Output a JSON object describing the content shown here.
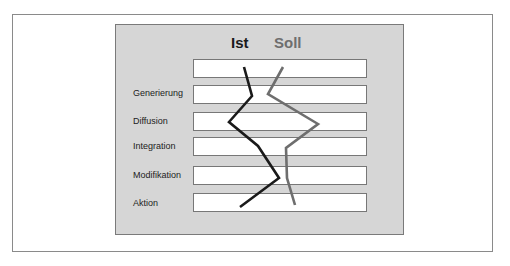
{
  "diagram": {
    "headers": {
      "ist": "Ist",
      "soll": "Soll"
    },
    "rows": [
      {
        "label": ""
      },
      {
        "label": "Generierung"
      },
      {
        "label": "Diffusion"
      },
      {
        "label": "Integration"
      },
      {
        "label": "Modifikation"
      },
      {
        "label": "Aktion"
      }
    ],
    "series": [
      {
        "name": "Ist",
        "color": "#1a1a1a",
        "points": [
          [
            244,
            67
          ],
          [
            252,
            96
          ],
          [
            229,
            122
          ],
          [
            258,
            146
          ],
          [
            279,
            178
          ],
          [
            240,
            207
          ]
        ]
      },
      {
        "name": "Soll",
        "color": "#6e6e6e",
        "points": [
          [
            283,
            67
          ],
          [
            268,
            94
          ],
          [
            318,
            124
          ],
          [
            286,
            148
          ],
          [
            287,
            178
          ],
          [
            295,
            205
          ]
        ]
      }
    ],
    "colors": {
      "panel": "#d6d6d6",
      "bar": "#ffffff",
      "ist": "#1a1a1a",
      "soll": "#6e6e6e"
    }
  }
}
